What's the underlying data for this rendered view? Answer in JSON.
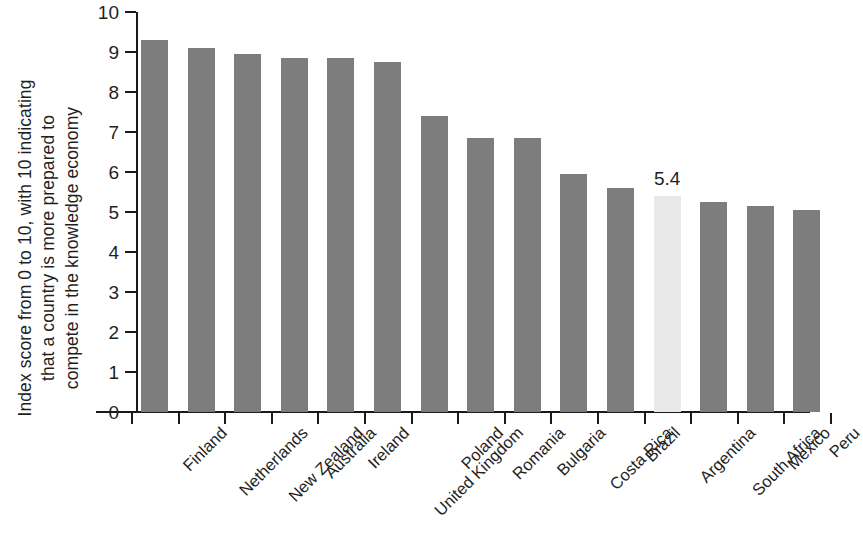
{
  "chart_data": {
    "type": "bar",
    "title": "",
    "subtitle": "",
    "xlabel": "",
    "ylabel": "Index score from 0 to 10, with 10 indicating that a country is more prepared to compete in the knowledge economy",
    "ylabel_lines": [
      "Index score from 0 to 10, with 10 indicating",
      "that a country is more prepared to",
      "compete in the knowledge economy"
    ],
    "ylim": [
      0,
      10
    ],
    "ytick_values": [
      0,
      1,
      2,
      3,
      4,
      5,
      6,
      7,
      8,
      9,
      10
    ],
    "ytick_labels": [
      "0",
      "1",
      "2",
      "3",
      "4",
      "5",
      "6",
      "7",
      "8",
      "9",
      "10"
    ],
    "grid": false,
    "legend": false,
    "legend_position": "none",
    "categories": [
      "Finland",
      "Netherlands",
      "New Zealand",
      "Australia",
      "Ireland",
      "United Kingdom",
      "Poland",
      "Romania",
      "Bulgaria",
      "Costa Rica",
      "Brazil",
      "Argentina",
      "South Africa",
      "Mexico",
      "Peru"
    ],
    "values": [
      9.3,
      9.1,
      8.95,
      8.85,
      8.85,
      8.75,
      7.4,
      6.85,
      6.85,
      5.95,
      5.6,
      5.4,
      5.25,
      5.15,
      5.05
    ],
    "highlight_index": 11,
    "data_labels": [
      null,
      null,
      null,
      null,
      null,
      null,
      null,
      null,
      null,
      null,
      null,
      "5.4",
      null,
      null,
      null
    ],
    "colors": {
      "bar": "#7d7d7d",
      "bar_highlight": "#e9e9e9",
      "axis": "#1a1a1a",
      "text": "#1f1f1f",
      "background": "#ffffff"
    }
  }
}
